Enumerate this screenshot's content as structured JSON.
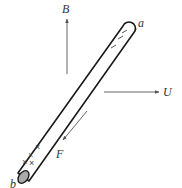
{
  "figure": {
    "rod": {
      "end_top_label": "a",
      "end_bottom_label": "b",
      "top_charges": [
        "–",
        "–",
        "–"
      ],
      "bottom_charges": [
        "×",
        "×",
        "×",
        "×"
      ]
    },
    "vectors": {
      "magnetic_field": {
        "label": "B",
        "direction": "up"
      },
      "velocity": {
        "label": "U",
        "direction": "right"
      },
      "force": {
        "label": "F",
        "direction": "down-left"
      }
    }
  },
  "colors": {
    "rod_outline": "#1a1a1a",
    "arrow": "#555555",
    "end_cap_fill": "#aaaaaa",
    "text": "#333333"
  }
}
